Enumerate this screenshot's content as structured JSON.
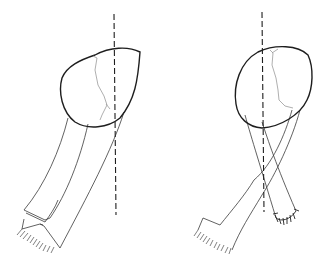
{
  "figure": {
    "panels": [
      {
        "id": "left",
        "description": "Bone head with single graft strip descending to lower-left, folded end and frayed tip; dashed vertical reference axis",
        "elements": [
          "bone-head",
          "fracture-line",
          "graft-strip",
          "folded-end",
          "frayed-end",
          "reference-axis"
        ]
      },
      {
        "id": "right",
        "description": "Bone head with crossed graft limbs; one limb to lower-left with frayed end, one limb to lower-right sutured end; dashed vertical reference axis",
        "elements": [
          "bone-head",
          "fracture-line",
          "graft-limb-left",
          "graft-limb-right",
          "frayed-end",
          "suture-line",
          "reference-axis"
        ]
      }
    ],
    "colors": {
      "background": "#ffffff",
      "outline": "#1e1e1e",
      "fracture": "#9a9a9a",
      "strap": "#3a3a3a"
    }
  }
}
